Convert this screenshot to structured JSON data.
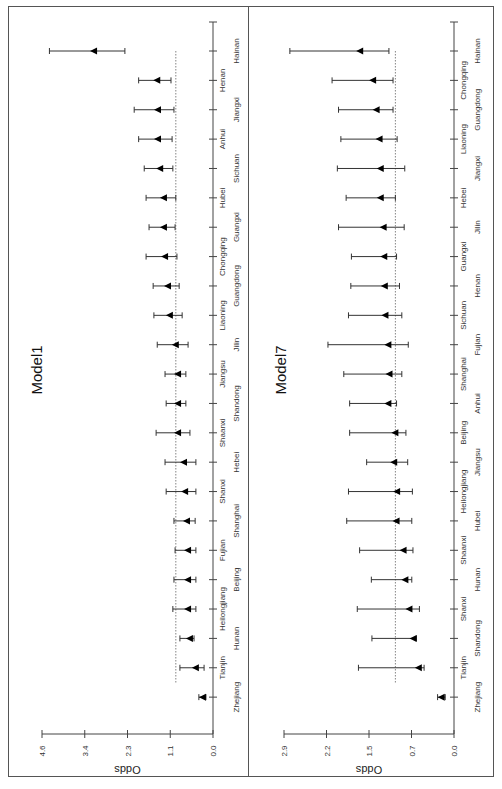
{
  "chart_data": [
    {
      "type": "forest",
      "title": "Model1",
      "ylabel": "Odds",
      "orientation": "rotated-90-ccw",
      "value_ticks": [
        "0.0",
        "1.1",
        "2.3",
        "3.4",
        "4.6"
      ],
      "ylim": [
        0,
        4.6
      ],
      "reference_line": 1.0,
      "categories": [
        "Hainan",
        "Henan",
        "Jiangxi",
        "Anhui",
        "Sichuan",
        "Hubei",
        "Guangxi",
        "Chongqing",
        "Guangdong",
        "Liaoning",
        "Jilin",
        "Jiangsu",
        "Shandong",
        "Shaanxi",
        "Hebei",
        "Shanxi",
        "Shanghai",
        "Fujian",
        "Beijing",
        "Heilongjiang",
        "Hunan",
        "Tianjin",
        "Zhejiang"
      ],
      "values": [
        3.2,
        1.5,
        1.48,
        1.48,
        1.42,
        1.32,
        1.32,
        1.29,
        1.21,
        1.16,
        1.0,
        0.94,
        0.94,
        0.94,
        0.78,
        0.75,
        0.7,
        0.67,
        0.67,
        0.67,
        0.62,
        0.46,
        0.27
      ],
      "ci_low": [
        2.37,
        1.13,
        1.05,
        1.1,
        1.08,
        1.0,
        1.02,
        0.97,
        0.91,
        0.83,
        0.67,
        0.73,
        0.73,
        0.62,
        0.46,
        0.46,
        0.48,
        0.46,
        0.46,
        0.46,
        0.51,
        0.24,
        0.19
      ],
      "ci_high": [
        4.4,
        2.0,
        2.12,
        2.0,
        1.85,
        1.8,
        1.72,
        1.8,
        1.61,
        1.59,
        1.5,
        1.29,
        1.26,
        1.53,
        1.29,
        1.26,
        1.05,
        1.02,
        1.05,
        1.08,
        0.89,
        0.89,
        0.38
      ]
    },
    {
      "type": "forest",
      "title": "Model7",
      "ylabel": "Odds",
      "orientation": "rotated-90-ccw",
      "value_ticks": [
        "0.0",
        "0.7",
        "1.5",
        "2.2",
        "2.9"
      ],
      "ylim": [
        0,
        2.9
      ],
      "reference_line": 1.0,
      "categories": [
        "Hainan",
        "Chongqing",
        "Guangdong",
        "Liaoning",
        "Jiangxi",
        "Hebei",
        "Jilin",
        "Guangxi",
        "Henan",
        "Sichuan",
        "Fujian",
        "Shanghai",
        "Anhui",
        "Beijing",
        "Jiangsu",
        "Heilongjiang",
        "Hubei",
        "Shaanxi",
        "Hunan",
        "Shanxi",
        "Shandong",
        "Tianjin",
        "Zhejiang"
      ],
      "values": [
        1.6,
        1.38,
        1.32,
        1.27,
        1.25,
        1.25,
        1.2,
        1.19,
        1.18,
        1.17,
        1.12,
        1.1,
        1.12,
        1.0,
        1.02,
        0.97,
        0.98,
        0.86,
        0.83,
        0.76,
        0.69,
        0.6,
        0.21
      ],
      "ci_low": [
        1.11,
        1.04,
        1.04,
        0.97,
        0.84,
        1.0,
        0.85,
        0.98,
        0.93,
        0.89,
        0.78,
        0.89,
        0.98,
        0.82,
        0.79,
        0.71,
        0.72,
        0.7,
        0.72,
        0.59,
        0.64,
        0.51,
        0.15
      ],
      "ci_high": [
        2.8,
        2.08,
        1.97,
        1.93,
        1.99,
        1.84,
        1.97,
        1.75,
        1.76,
        1.8,
        2.15,
        1.88,
        1.78,
        1.78,
        1.49,
        1.8,
        1.83,
        1.61,
        1.41,
        1.65,
        1.4,
        1.63,
        0.28
      ]
    }
  ]
}
